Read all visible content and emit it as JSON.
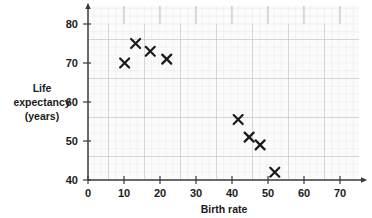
{
  "chart_data": {
    "type": "scatter",
    "title": "",
    "xlabel": "Birth rate",
    "ylabel": "Life expectancy (years)",
    "ylabel_lines": [
      "Life",
      "expectancy",
      "(years)"
    ],
    "xlim": [
      0,
      74
    ],
    "ylim": [
      40,
      84
    ],
    "xticks": [
      0,
      10,
      20,
      30,
      40,
      50,
      60,
      70
    ],
    "xtick_labels": [
      "0",
      "10",
      "20",
      "30",
      "40",
      "50",
      "60",
      "70"
    ],
    "yticks": [
      40,
      50,
      60,
      70,
      80
    ],
    "ytick_labels": [
      "40",
      "50",
      "60",
      "70",
      "80"
    ],
    "grid": true,
    "grid_minor_step": 2,
    "grid_major_step": 10,
    "legend": "none",
    "marker": "x",
    "points": [
      {
        "x": 10,
        "y": 70
      },
      {
        "x": 13,
        "y": 75
      },
      {
        "x": 17,
        "y": 73
      },
      {
        "x": 21.5,
        "y": 71
      },
      {
        "x": 41,
        "y": 55.5
      },
      {
        "x": 44,
        "y": 51
      },
      {
        "x": 47,
        "y": 49
      },
      {
        "x": 51,
        "y": 42
      }
    ]
  },
  "colors": {
    "marker": "#1a1a1a",
    "axis": "#3a3a3a",
    "grid_minor": "#d8d8d8",
    "grid_major": "#b4b4b4",
    "background": "#ffffff",
    "plot_background": "#fbfbfb",
    "text": "#1b1b1b"
  }
}
